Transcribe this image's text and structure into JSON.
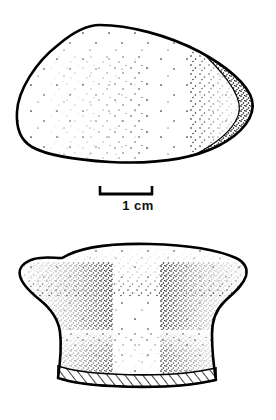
{
  "plate": {
    "title": "Lithic artifact illustration plate",
    "background_color": "#ffffff",
    "ink_color": "#000000",
    "width": 276,
    "height": 420
  },
  "scale_bar": {
    "label": "1 cm",
    "length_px": 52,
    "left_px": 100,
    "right_px": 152,
    "baseline_y_px": 195,
    "tick_height_px": 9,
    "units": "cm",
    "value": 1
  },
  "figures": [
    {
      "name": "upper-artifact",
      "view": "dorsal-plan-view",
      "description": "Ovate cobble tool seen in plan, outlined in heavy ink with stipple shading across the interior and a dense stippled ridge along the right margin.",
      "bounds": {
        "x": 17,
        "y": 24,
        "width": 237,
        "height": 140
      },
      "shading": "stipple",
      "hatching": false
    },
    {
      "name": "lower-artifact",
      "view": "profile-section-view",
      "description": "Waisted profile or cross-section of the same tool, stippled on both flanks with a diagonally hatched band marking the cut base.",
      "bounds": {
        "x": 20,
        "y": 243,
        "width": 228,
        "height": 153
      },
      "shading": "stipple",
      "hatching": true,
      "hatch_band": "base"
    }
  ],
  "caption": {
    "fragment_text": "",
    "visible": false
  }
}
